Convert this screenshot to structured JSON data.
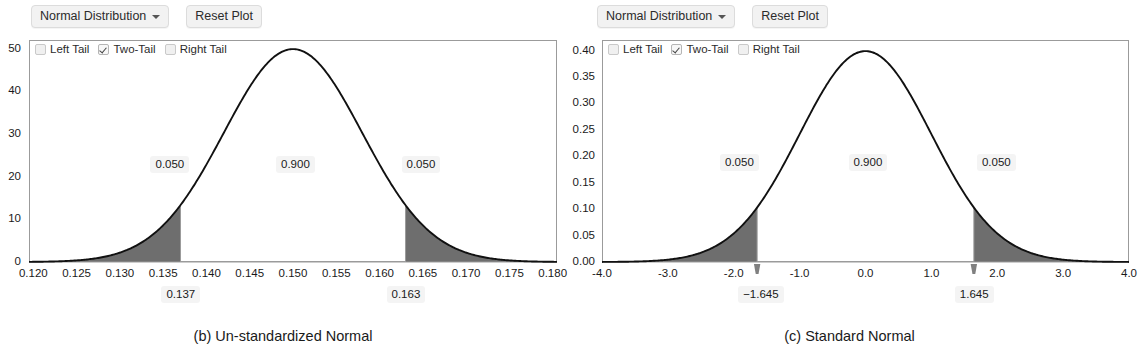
{
  "panels": [
    {
      "id": "unstandardized",
      "caption": "(b) Un-standardized Normal",
      "toolbar": {
        "distribution_label": "Normal Distribution",
        "caret_icon": "chevron-down-icon",
        "reset_label": "Reset Plot"
      },
      "legend": [
        {
          "label": "Left Tail",
          "checked": false
        },
        {
          "label": "Two-Tail",
          "checked": true
        },
        {
          "label": "Right Tail",
          "checked": false
        }
      ],
      "chart_data": {
        "type": "area",
        "title": "",
        "xlabel": "",
        "ylabel": "",
        "distribution": "normal",
        "mean": 0.15,
        "sd": 0.008,
        "xlim": [
          0.1195,
          0.1805
        ],
        "ylim": [
          0,
          52
        ],
        "xticks": [
          "0.120",
          "0.125",
          "0.130",
          "0.135",
          "0.140",
          "0.145",
          "0.150",
          "0.155",
          "0.160",
          "0.165",
          "0.170",
          "0.175",
          "0.180"
        ],
        "xtick_values": [
          0.12,
          0.125,
          0.13,
          0.135,
          0.14,
          0.145,
          0.15,
          0.155,
          0.16,
          0.165,
          0.17,
          0.175,
          0.18
        ],
        "yticks": [
          "0",
          "10",
          "20",
          "30",
          "40",
          "50"
        ],
        "ytick_values": [
          0,
          10,
          20,
          30,
          40,
          50
        ],
        "grid": false,
        "peak_density": 49.9,
        "shaded_regions": [
          {
            "name": "left-tail",
            "from": 0.1195,
            "to": 0.137,
            "area": 0.05
          },
          {
            "name": "right-tail",
            "from": 0.163,
            "to": 0.1805,
            "area": 0.05
          }
        ],
        "area_labels": [
          {
            "text": "0.050",
            "x": 0.1355,
            "y": 23
          },
          {
            "text": "0.900",
            "x": 0.15,
            "y": 23
          },
          {
            "text": "0.050",
            "x": 0.1645,
            "y": 23
          }
        ],
        "cut_labels": [
          {
            "text": "0.137",
            "x": 0.137
          },
          {
            "text": "0.163",
            "x": 0.163
          }
        ],
        "handles": false
      }
    },
    {
      "id": "standard",
      "caption": "(c) Standard Normal",
      "toolbar": {
        "distribution_label": "Normal Distribution",
        "caret_icon": "chevron-down-icon",
        "reset_label": "Reset Plot"
      },
      "legend": [
        {
          "label": "Left Tail",
          "checked": false
        },
        {
          "label": "Two-Tail",
          "checked": true
        },
        {
          "label": "Right Tail",
          "checked": false
        }
      ],
      "chart_data": {
        "type": "area",
        "title": "",
        "xlabel": "",
        "ylabel": "",
        "distribution": "normal",
        "mean": 0.0,
        "sd": 1.0,
        "xlim": [
          -4.0,
          4.0
        ],
        "ylim": [
          0,
          0.42
        ],
        "xticks": [
          "-4.0",
          "-3.0",
          "-2.0",
          "-1.0",
          "0.0",
          "1.0",
          "2.0",
          "3.0",
          "4.0"
        ],
        "xtick_values": [
          -4,
          -3,
          -2,
          -1,
          0,
          1,
          2,
          3,
          4
        ],
        "yticks": [
          "0.00",
          "0.05",
          "0.10",
          "0.15",
          "0.20",
          "0.25",
          "0.30",
          "0.35",
          "0.40"
        ],
        "ytick_values": [
          0,
          0.05,
          0.1,
          0.15,
          0.2,
          0.25,
          0.3,
          0.35,
          0.4
        ],
        "grid": false,
        "peak_density": 0.399,
        "shaded_regions": [
          {
            "name": "left-tail",
            "from": -4.0,
            "to": -1.645,
            "area": 0.05
          },
          {
            "name": "right-tail",
            "from": 1.645,
            "to": 4.0,
            "area": 0.05
          }
        ],
        "area_labels": [
          {
            "text": "0.050",
            "x": -1.95,
            "y": 0.19
          },
          {
            "text": "0.900",
            "x": 0.0,
            "y": 0.19
          },
          {
            "text": "0.050",
            "x": 1.95,
            "y": 0.19
          }
        ],
        "cut_labels": [
          {
            "text": "−1.645",
            "x": -1.645
          },
          {
            "text": "1.645",
            "x": 1.645
          }
        ],
        "handles": true
      }
    }
  ],
  "colors": {
    "curve": "#111111",
    "tail_fill": "#6e6e6e",
    "frame": "#9b9b9b",
    "chip_bg": "#f4f4f4",
    "button_bg": "#f2f2f2"
  }
}
